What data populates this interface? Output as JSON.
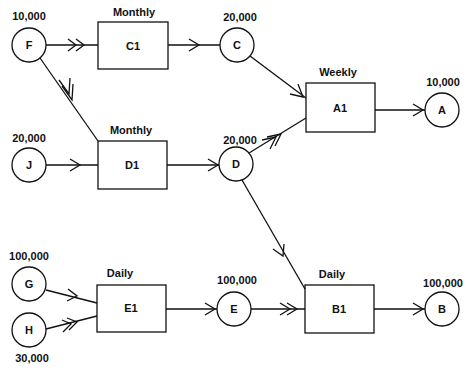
{
  "diagram": {
    "type": "production-network",
    "circles": [
      {
        "id": "F",
        "label": "F",
        "quantity": "10,000"
      },
      {
        "id": "J",
        "label": "J",
        "quantity": "20,000"
      },
      {
        "id": "G",
        "label": "G",
        "quantity": "100,000"
      },
      {
        "id": "H",
        "label": "H",
        "quantity": "30,000"
      },
      {
        "id": "C",
        "label": "C",
        "quantity": "20,000"
      },
      {
        "id": "D",
        "label": "D",
        "quantity": "20,000"
      },
      {
        "id": "E",
        "label": "E",
        "quantity": "100,000"
      },
      {
        "id": "A",
        "label": "A",
        "quantity": "10,000"
      },
      {
        "id": "B",
        "label": "B",
        "quantity": "100,000"
      }
    ],
    "boxes": [
      {
        "id": "C1",
        "label": "C1",
        "frequency": "Monthly"
      },
      {
        "id": "D1",
        "label": "D1",
        "frequency": "Monthly"
      },
      {
        "id": "E1",
        "label": "E1",
        "frequency": "Daily"
      },
      {
        "id": "A1",
        "label": "A1",
        "frequency": "Weekly"
      },
      {
        "id": "B1",
        "label": "B1",
        "frequency": "Daily"
      }
    ],
    "edges": [
      {
        "from": "F",
        "to": "C1",
        "arrow": "double"
      },
      {
        "from": "F",
        "to": "D1",
        "arrow": "double"
      },
      {
        "from": "J",
        "to": "D1",
        "arrow": "single"
      },
      {
        "from": "C1",
        "to": "C",
        "arrow": "single"
      },
      {
        "from": "D1",
        "to": "D",
        "arrow": "single"
      },
      {
        "from": "C",
        "to": "A1",
        "arrow": "single"
      },
      {
        "from": "D",
        "to": "A1",
        "arrow": "double"
      },
      {
        "from": "D",
        "to": "B1",
        "arrow": "single"
      },
      {
        "from": "A1",
        "to": "A",
        "arrow": "single"
      },
      {
        "from": "G",
        "to": "E1",
        "arrow": "single"
      },
      {
        "from": "H",
        "to": "E1",
        "arrow": "double"
      },
      {
        "from": "E1",
        "to": "E",
        "arrow": "single"
      },
      {
        "from": "E",
        "to": "B1",
        "arrow": "double"
      },
      {
        "from": "B1",
        "to": "B",
        "arrow": "single"
      }
    ]
  }
}
